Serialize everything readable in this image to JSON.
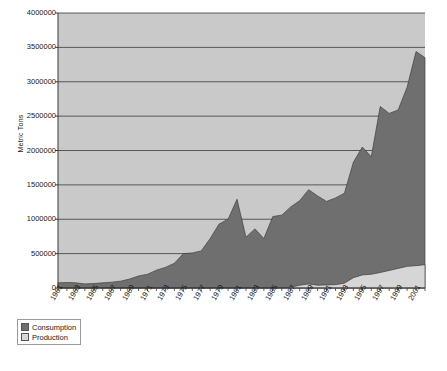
{
  "chart_data": {
    "type": "area",
    "title": "",
    "subtitle": "",
    "xlabel": "",
    "ylabel": "Metric Tons",
    "ylim": [
      0,
      4000000
    ],
    "ytick_step": 500000,
    "yticks": [
      "0",
      "500000",
      "1000000",
      "1500000",
      "2000000",
      "2500000",
      "3000000",
      "3500000",
      "4000000"
    ],
    "grid": true,
    "grid_axis": "y",
    "legend_position": "below-left",
    "x": [
      1961,
      1962,
      1963,
      1964,
      1965,
      1966,
      1967,
      1968,
      1969,
      1970,
      1971,
      1972,
      1973,
      1974,
      1975,
      1976,
      1977,
      1978,
      1979,
      1980,
      1981,
      1982,
      1983,
      1984,
      1985,
      1986,
      1987,
      1988,
      1989,
      1990,
      1991,
      1992,
      1993,
      1994,
      1995,
      1996,
      1997,
      1998,
      1999,
      2000,
      2001,
      2002
    ],
    "xticks": [
      "1961",
      "1963",
      "1965",
      "1967",
      "1969",
      "1971",
      "1973",
      "1975",
      "1977",
      "1979",
      "1981",
      "1983",
      "1985",
      "1987",
      "1989",
      "1991",
      "1993",
      "1995",
      "1997",
      "1999",
      "2001"
    ],
    "xtick_interval": 2,
    "series": [
      {
        "name": "Consumption",
        "color": "#6f6f6f",
        "values": [
          75000,
          80000,
          75000,
          60000,
          65000,
          75000,
          85000,
          100000,
          130000,
          175000,
          200000,
          260000,
          300000,
          360000,
          500000,
          510000,
          540000,
          720000,
          930000,
          1000000,
          1290000,
          740000,
          860000,
          720000,
          1040000,
          1060000,
          1180000,
          1270000,
          1430000,
          1340000,
          1260000,
          1310000,
          1380000,
          1830000,
          2050000,
          1910000,
          2640000,
          2540000,
          2590000,
          2920000,
          3440000,
          3350000
        ]
      },
      {
        "name": "Production",
        "color": "#d6d6d6",
        "values": [
          1000,
          1000,
          1000,
          1000,
          1000,
          1000,
          1000,
          1000,
          1000,
          1000,
          1000,
          1000,
          1000,
          1000,
          1000,
          1000,
          1000,
          1000,
          1000,
          1000,
          1000,
          1000,
          1000,
          1000,
          1000,
          3000,
          12000,
          40000,
          58000,
          40000,
          45000,
          48000,
          70000,
          150000,
          190000,
          200000,
          225000,
          255000,
          285000,
          315000,
          325000,
          340000
        ]
      }
    ]
  },
  "legend": {
    "items": [
      {
        "label": "Consumption",
        "swatch": "#6f6f6f"
      },
      {
        "label": "Production",
        "swatch": "#d6d6d6"
      }
    ]
  },
  "colors": {
    "plot_background": "#c9c9c9",
    "consumption_fill": "#6f6f6f",
    "production_fill": "#d6d6d6",
    "gridline": "#4a4a4a",
    "axis_line": "#3a3a3a",
    "page_background": "#ffffff"
  }
}
